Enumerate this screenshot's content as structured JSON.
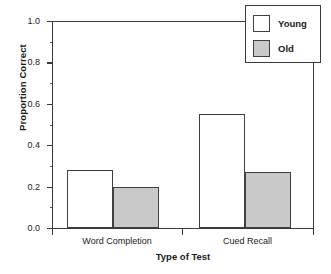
{
  "chart_data": {
    "type": "bar",
    "title": "",
    "xlabel": "Type of Test",
    "ylabel": "Proportion Correct",
    "categories": [
      "Word Completion",
      "Cued Recall"
    ],
    "series": [
      {
        "name": "Young",
        "values": [
          0.28,
          0.55
        ],
        "color": "#ffffff"
      },
      {
        "name": "Old",
        "values": [
          0.2,
          0.27
        ],
        "color": "#c9c9c9"
      }
    ],
    "ylim": [
      0.0,
      1.0
    ],
    "yticks": [
      "0.0",
      "0.2",
      "0.4",
      "0.6",
      "0.8",
      "1.0"
    ],
    "ytick_values": [
      0.0,
      0.2,
      0.4,
      0.6,
      0.8,
      1.0
    ],
    "yminor_values": [
      0.1,
      0.3,
      0.5,
      0.7,
      0.9
    ],
    "grid": false,
    "legend_position": "top-right",
    "legend_entries": [
      "Young",
      "Old"
    ]
  },
  "axis": {
    "y_title": "Proportion Correct",
    "x_title": "Type of Test",
    "y_labels": {
      "t0": "0.0",
      "t1": "0.2",
      "t2": "0.4",
      "t3": "0.6",
      "t4": "0.8",
      "t5": "1.0"
    },
    "x_labels": {
      "g0": "Word Completion",
      "g1": "Cued Recall"
    }
  },
  "legend": {
    "rows": [
      {
        "label": "Young"
      },
      {
        "label": "Old"
      }
    ]
  },
  "caption": {
    "sliver_text": ""
  }
}
